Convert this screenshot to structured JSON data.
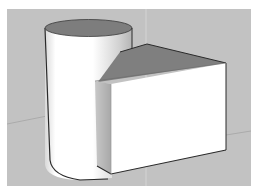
{
  "scene": {
    "description": "3D modeling viewport showing a cylinder merged with a rectangular box",
    "colors": {
      "background": "#ffffff",
      "viewport": "#c2c2c2",
      "axis_line": "#d8d8d8",
      "ground_axis": "#a9a9a9",
      "cylinder_top": "#7d7d7d",
      "cylinder_body_light": "#ffffff",
      "cylinder_body_shade": "#b9b9b9",
      "box_top": "#7f7f7f",
      "box_front": "#ffffff",
      "box_side": "#b4b4b4",
      "edge": "#2a2a2a"
    },
    "objects": [
      {
        "name": "cylinder",
        "label": ""
      },
      {
        "name": "box",
        "label": ""
      }
    ]
  }
}
